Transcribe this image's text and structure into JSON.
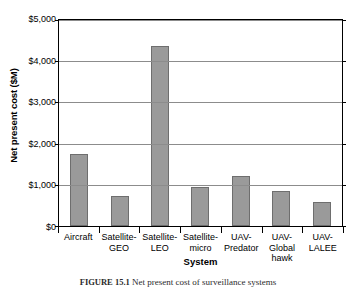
{
  "chart_data": {
    "type": "bar",
    "title": "",
    "xlabel": "System",
    "ylabel": "Net present cost ($M)",
    "categories": [
      "Aircraft",
      "Satellite-GEO",
      "Satellite-LEO",
      "Satellite-micro",
      "UAV-Predator",
      "UAV-Global hawk",
      "UAV-LALEE"
    ],
    "category_lines": [
      "Aircraft",
      "Satellite-\nGEO",
      "Satellite-\nLEO",
      "Satellite-\nmicro",
      "UAV-\nPredator",
      "UAV-Global\nhawk",
      "UAV-\nLALEE"
    ],
    "values": [
      1720,
      710,
      4320,
      940,
      1210,
      840,
      570
    ],
    "ylim": [
      0,
      5000
    ],
    "ytick_values": [
      0,
      1000,
      2000,
      3000,
      4000,
      5000
    ],
    "ytick_labels": [
      "$0",
      "$1,000",
      "$2,000",
      "$3,000",
      "$4,000",
      "$5,000"
    ],
    "grid": true,
    "legend": false,
    "bar_color": "#9a9a9a",
    "bar_edge_color": "#6e6e6e",
    "gridline_color": "#8c8c8c",
    "axis_color": "#000000"
  },
  "caption": {
    "label": "FIGURE 15.1",
    "text": "Net present cost of surveillance systems"
  }
}
